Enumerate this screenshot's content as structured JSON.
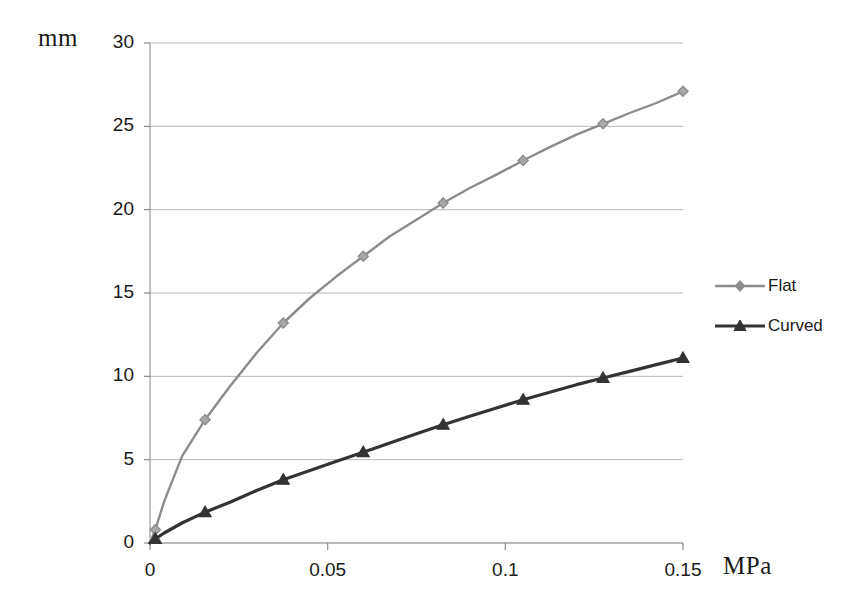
{
  "chart_data": {
    "type": "line",
    "title": "",
    "subtitle": "",
    "xlabel": "MPa",
    "ylabel": "mm",
    "xlim": [
      0,
      0.15
    ],
    "ylim": [
      0,
      30
    ],
    "xticks": [
      "0",
      "0.05",
      "0.1",
      "0.15"
    ],
    "xtick_values": [
      0,
      0.05,
      0.1,
      0.15
    ],
    "yticks": [
      "0",
      "5",
      "10",
      "15",
      "20",
      "25",
      "30"
    ],
    "ytick_values": [
      0,
      5,
      10,
      15,
      20,
      25,
      30
    ],
    "grid": "horizontal",
    "legend_position": "right",
    "series": [
      {
        "name": "Flat",
        "color": "#8c8c8c",
        "marker": "diamond",
        "x": [
          0.0,
          0.0015,
          0.004,
          0.009,
          0.0155,
          0.0225,
          0.03,
          0.0375,
          0.045,
          0.0525,
          0.06,
          0.0675,
          0.075,
          0.0825,
          0.09,
          0.0975,
          0.105,
          0.1125,
          0.12,
          0.1275,
          0.135,
          0.1425,
          0.15
        ],
        "values": [
          0.0,
          0.8,
          2.5,
          5.2,
          7.4,
          9.4,
          11.4,
          13.2,
          14.7,
          16.0,
          17.2,
          18.4,
          19.4,
          20.4,
          21.3,
          22.1,
          22.95,
          23.75,
          24.5,
          25.15,
          25.8,
          26.4,
          27.1
        ]
      },
      {
        "name": "Curved",
        "color": "#333333",
        "marker": "triangle",
        "x": [
          0.0,
          0.0015,
          0.004,
          0.009,
          0.0155,
          0.0225,
          0.03,
          0.0375,
          0.045,
          0.0525,
          0.06,
          0.0675,
          0.075,
          0.0825,
          0.09,
          0.0975,
          0.105,
          0.1125,
          0.12,
          0.1275,
          0.135,
          0.1425,
          0.15
        ],
        "values": [
          0.0,
          0.25,
          0.6,
          1.2,
          1.85,
          2.45,
          3.15,
          3.8,
          4.35,
          4.9,
          5.45,
          6.0,
          6.55,
          7.1,
          7.6,
          8.1,
          8.6,
          9.05,
          9.5,
          9.9,
          10.3,
          10.7,
          11.1
        ]
      }
    ]
  },
  "legend": {
    "items": [
      {
        "label": "Flat"
      },
      {
        "label": "Curved"
      }
    ]
  },
  "axes": {
    "y_unit": "mm",
    "x_unit": "MPa"
  }
}
